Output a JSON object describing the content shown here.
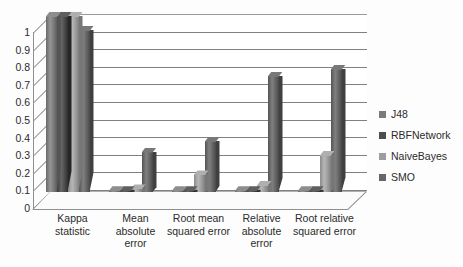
{
  "chart_data": {
    "type": "bar",
    "title": "",
    "subtitle": "",
    "xlabel": "",
    "ylabel": "",
    "ylim": [
      0,
      1
    ],
    "grid": true,
    "legend_position": "right",
    "categories": [
      "Kappa statistic",
      "Mean absolute error",
      "Root mean squared error",
      "Relative absolute error",
      "Root relative squared error"
    ],
    "ytick_labels": [
      "1",
      "0.9",
      "0.8",
      "0.7",
      "0.6",
      "0.5",
      "0.4",
      "0.3",
      "0.2",
      "0.1",
      "0"
    ],
    "ytick_values": [
      1,
      0.9,
      0.8,
      0.7,
      0.6,
      0.5,
      0.4,
      0.3,
      0.2,
      0.1,
      0
    ],
    "series": [
      {
        "name": "J48",
        "color": "#7b7b7b",
        "values": [
          1.0,
          0.01,
          0.01,
          0.01,
          0.01
        ]
      },
      {
        "name": "RBFNetwork",
        "color": "#4d4d4d",
        "values": [
          1.0,
          0.01,
          0.01,
          0.01,
          0.01
        ]
      },
      {
        "name": "NaiveBayes",
        "color": "#9d9d9d",
        "values": [
          1.0,
          0.02,
          0.1,
          0.04,
          0.21
        ]
      },
      {
        "name": "SMO",
        "color": "#666666",
        "values": [
          0.92,
          0.23,
          0.29,
          0.66,
          0.7
        ]
      }
    ]
  },
  "legend": {
    "items": [
      {
        "label": "J48",
        "color": "#7b7b7b"
      },
      {
        "label": "RBFNetwork",
        "color": "#4d4d4d"
      },
      {
        "label": "NaiveBayes",
        "color": "#9d9d9d"
      },
      {
        "label": "SMO",
        "color": "#666666"
      }
    ]
  }
}
